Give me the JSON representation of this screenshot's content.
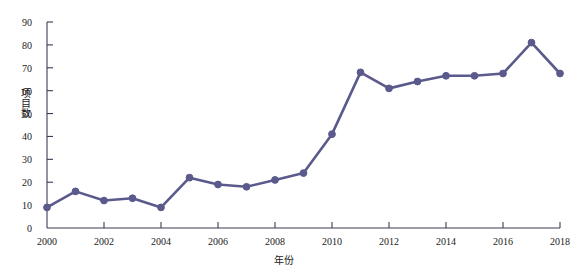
{
  "chart_data": {
    "type": "line",
    "title": "",
    "xlabel": "年份",
    "ylabel": "项目数",
    "x": [
      2000,
      2001,
      2002,
      2003,
      2004,
      2005,
      2006,
      2007,
      2008,
      2009,
      2010,
      2011,
      2012,
      2013,
      2014,
      2015,
      2016,
      2017,
      2018
    ],
    "values": [
      9,
      16,
      12,
      13,
      9,
      22,
      19,
      18,
      21,
      24,
      41,
      68,
      61,
      64,
      66.5,
      66.5,
      67.5,
      81,
      67.5
    ],
    "series": [
      {
        "name": "项目数",
        "values": [
          9,
          16,
          12,
          13,
          9,
          22,
          19,
          18,
          21,
          24,
          41,
          68,
          61,
          64,
          66.5,
          66.5,
          67.5,
          81,
          67.5
        ]
      }
    ],
    "xlim": [
      2000,
      2018
    ],
    "ylim": [
      0,
      90
    ],
    "xticks": [
      2000,
      2002,
      2004,
      2006,
      2008,
      2010,
      2012,
      2014,
      2016,
      2018
    ],
    "xtick_labels": [
      "2000",
      "2002",
      "2004",
      "2006",
      "2008",
      "2010",
      "2012",
      "2014",
      "2016",
      "2018"
    ],
    "yticks": [
      0,
      10,
      20,
      30,
      40,
      50,
      60,
      70,
      80,
      90
    ],
    "ytick_labels": [
      "0",
      "10",
      "20",
      "30",
      "40",
      "50",
      "60",
      "70",
      "80",
      "90"
    ],
    "grid": false,
    "legend": "none",
    "line_color": "#5b5a8c",
    "marker_color": "#5b5a8c",
    "marker": "circle",
    "axis_color": "#3b3b55"
  }
}
